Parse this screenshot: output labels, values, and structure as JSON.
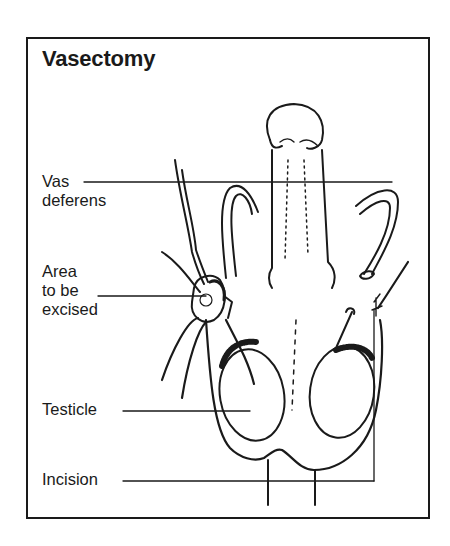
{
  "title": "Vasectomy",
  "labels": {
    "vas_deferens": [
      "Vas",
      "deferens"
    ],
    "area_excised": [
      "Area",
      "to be",
      "excised"
    ],
    "testicle": "Testicle",
    "incision": "Incision"
  },
  "colors": {
    "ink": "#1a1a1a",
    "background": "#ffffff"
  }
}
